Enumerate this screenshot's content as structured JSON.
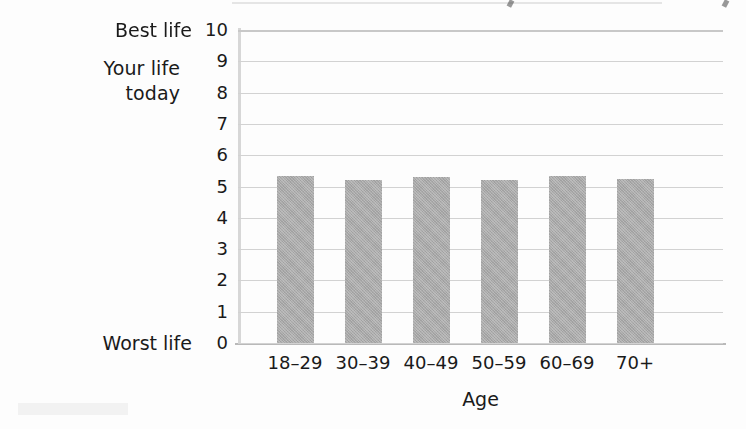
{
  "figure": {
    "background_color": "#fdfdfd",
    "bar_color": "#a9a9a9",
    "gridline_color": "#d2d2d2",
    "axis_color": "#b9b9b9"
  },
  "annotations": {
    "y_axis_title_line1": "Your life",
    "y_axis_title_line2": "today",
    "best_life_label": "Best life",
    "worst_life_label": "Worst life"
  },
  "chart_data": {
    "type": "bar",
    "title": "",
    "subtitle": "",
    "xlabel": "Age",
    "ylabel": "Your life today",
    "categories": [
      "18–29",
      "30–39",
      "40–49",
      "50–59",
      "60–69",
      "70+"
    ],
    "values": [
      5.35,
      5.2,
      5.3,
      5.2,
      5.35,
      5.25
    ],
    "series": [
      {
        "name": "Your life today",
        "values": [
          5.35,
          5.2,
          5.3,
          5.2,
          5.35,
          5.25
        ]
      }
    ],
    "ylim": [
      0,
      10
    ],
    "yticks": [
      0,
      1,
      2,
      3,
      4,
      5,
      6,
      7,
      8,
      9,
      10
    ],
    "ytick_labels": [
      "0",
      "1",
      "2",
      "3",
      "4",
      "5",
      "6",
      "7",
      "8",
      "9",
      "10"
    ],
    "y_axis_endpoint_labels": {
      "min": "Worst life",
      "max": "Best life"
    },
    "grid": "horizontal",
    "legend": "none",
    "orientation": "vertical"
  }
}
